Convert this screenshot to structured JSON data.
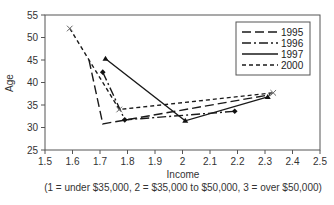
{
  "chart_data": {
    "type": "line",
    "title": "",
    "xlabel": "Income",
    "xlabel_note": "(1 = under $35,000,  2 = $35,000 to $50,000,  3 = over $50,000)",
    "ylabel": "Age",
    "xlim": [
      1.5,
      2.5
    ],
    "ylim": [
      25,
      55
    ],
    "xticks": [
      "1.5",
      "1.6",
      "1.7",
      "1.8",
      "1.9",
      "2",
      "2.1",
      "2.2",
      "2.3",
      "2.4",
      "2.5"
    ],
    "yticks": [
      "25",
      "30",
      "35",
      "40",
      "45",
      "50",
      "55"
    ],
    "grid": false,
    "legend_position": "top-right",
    "series": [
      {
        "name": "1995",
        "style": "long-dash",
        "marker": "none",
        "points": [
          [
            1.66,
            45.0
          ],
          [
            1.71,
            30.8
          ],
          [
            2.32,
            37.3
          ]
        ]
      },
      {
        "name": "1996",
        "style": "dash-dot",
        "marker": "diamond",
        "points": [
          [
            1.71,
            42.3
          ],
          [
            1.79,
            31.7
          ],
          [
            2.19,
            33.6
          ]
        ]
      },
      {
        "name": "1997",
        "style": "solid",
        "marker": "triangle",
        "points": [
          [
            1.72,
            45.3
          ],
          [
            2.01,
            31.5
          ],
          [
            2.31,
            36.8
          ]
        ]
      },
      {
        "name": "2000",
        "style": "short-dash",
        "marker": "x",
        "points": [
          [
            1.59,
            52.0
          ],
          [
            1.77,
            34.0
          ],
          [
            2.33,
            37.7
          ]
        ]
      }
    ]
  }
}
